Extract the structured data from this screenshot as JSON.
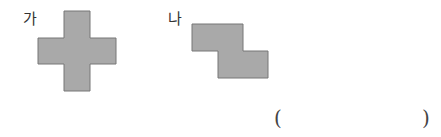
{
  "figures": [
    {
      "label": "가",
      "shape": "cross (plus) made of 5 squares"
    },
    {
      "label": "나",
      "shape": "S/Z shape made of 4 squares"
    }
  ],
  "answer_box": {
    "open": "(",
    "close": ")",
    "value": ""
  },
  "colors": {
    "fill": "#a9a9a9",
    "stroke": "#777777"
  }
}
